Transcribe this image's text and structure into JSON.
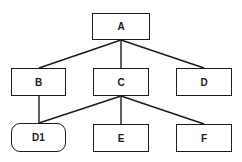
{
  "diagram": {
    "type": "tree",
    "nodes": [
      {
        "id": "A",
        "label": "A",
        "shape": "rect",
        "x": 92,
        "y": 13,
        "w": 58,
        "h": 27
      },
      {
        "id": "B",
        "label": "B",
        "shape": "rect",
        "x": 11,
        "y": 68,
        "w": 55,
        "h": 28
      },
      {
        "id": "C",
        "label": "C",
        "shape": "rect",
        "x": 93,
        "y": 68,
        "w": 56,
        "h": 28
      },
      {
        "id": "D",
        "label": "D",
        "shape": "rect",
        "x": 176,
        "y": 68,
        "w": 56,
        "h": 28
      },
      {
        "id": "D1",
        "label": "D1",
        "shape": "rounded-rect",
        "x": 11,
        "y": 123,
        "w": 55,
        "h": 29
      },
      {
        "id": "E",
        "label": "E",
        "shape": "rect",
        "x": 93,
        "y": 124,
        "w": 56,
        "h": 28
      },
      {
        "id": "F",
        "label": "F",
        "shape": "rect",
        "x": 176,
        "y": 124,
        "w": 56,
        "h": 28
      }
    ],
    "edges": [
      {
        "from": "A",
        "to": "B",
        "x1": 121,
        "y1": 40,
        "x2": 39,
        "y2": 68
      },
      {
        "from": "A",
        "to": "C",
        "x1": 121,
        "y1": 40,
        "x2": 121,
        "y2": 68
      },
      {
        "from": "A",
        "to": "D",
        "x1": 121,
        "y1": 40,
        "x2": 204,
        "y2": 68
      },
      {
        "from": "B",
        "to": "D1",
        "x1": 39,
        "y1": 96,
        "x2": 39,
        "y2": 123
      },
      {
        "from": "C",
        "to": "D1",
        "x1": 121,
        "y1": 96,
        "x2": 39,
        "y2": 123
      },
      {
        "from": "C",
        "to": "E",
        "x1": 121,
        "y1": 96,
        "x2": 121,
        "y2": 124
      },
      {
        "from": "C",
        "to": "F",
        "x1": 121,
        "y1": 96,
        "x2": 204,
        "y2": 124
      }
    ],
    "line_color": "#1a1a1a"
  }
}
